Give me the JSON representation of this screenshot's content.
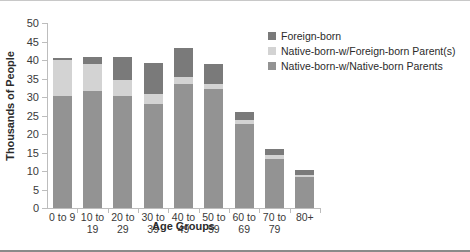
{
  "chart_data": {
    "type": "bar",
    "title": "",
    "subtitle": "",
    "xlabel": "Age Groups",
    "ylabel": "Thousands of People",
    "ylim": [
      0,
      50
    ],
    "yticks": [
      0,
      5,
      10,
      15,
      20,
      25,
      30,
      35,
      40,
      45,
      50
    ],
    "grid": false,
    "stacked": true,
    "legend_position": "top-right",
    "categories": [
      "0 to 9",
      "10 to 19",
      "20 to 29",
      "30 to 39",
      "40 to 49",
      "50 to 59",
      "60 to 69",
      "70 to 79",
      "80+"
    ],
    "category_lines": [
      [
        "0 to 9",
        ""
      ],
      [
        "10 to",
        "19"
      ],
      [
        "20 to",
        "29"
      ],
      [
        "30 to",
        "39"
      ],
      [
        "40 to",
        "49"
      ],
      [
        "50 to",
        "59"
      ],
      [
        "60 to",
        "69"
      ],
      [
        "70 to",
        "79"
      ],
      [
        "80+",
        ""
      ]
    ],
    "series": [
      {
        "name": "Native-born-w/Native-born Parents",
        "color": "#939393",
        "values": [
          30.3,
          31.6,
          30.3,
          28.0,
          33.5,
          32.1,
          22.6,
          13.3,
          8.4
        ]
      },
      {
        "name": "Native-born-w/Foreign-born Parent(s)",
        "color": "#d3d3d3",
        "values": [
          9.7,
          7.3,
          4.2,
          2.8,
          1.8,
          1.4,
          1.3,
          0.9,
          0.6
        ]
      },
      {
        "name": "Foreign-born",
        "color": "#7a7a7a",
        "values": [
          0.5,
          1.8,
          6.3,
          8.3,
          7.9,
          5.4,
          2.1,
          1.8,
          1.2
        ]
      }
    ],
    "totals": [
      40.5,
      40.7,
      40.8,
      39.1,
      43.2,
      38.9,
      26.0,
      16.0,
      10.2
    ]
  },
  "legend": {
    "entries": [
      {
        "label": "Foreign-born",
        "color": "#7a7a7a"
      },
      {
        "label": "Native-born-w/Foreign-born Parent(s)",
        "color": "#d3d3d3"
      },
      {
        "label": "Native-born-w/Native-born Parents",
        "color": "#939393"
      }
    ]
  }
}
